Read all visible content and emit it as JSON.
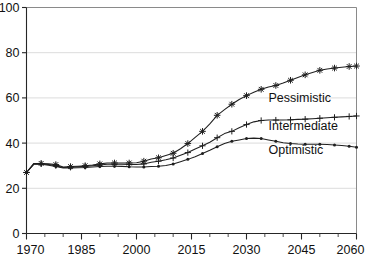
{
  "chart_data": {
    "type": "line",
    "title": "",
    "subtitle": "",
    "xlabel": "",
    "ylabel": "",
    "xlim": [
      1970,
      2060
    ],
    "ylim": [
      0,
      100
    ],
    "grid": true,
    "grid_axis": "y",
    "legend_position": "inline-annotations-right",
    "x_ticks": [
      1970,
      1985,
      2000,
      2015,
      2030,
      2045,
      2060
    ],
    "x_tick_labels": [
      "1970",
      "1985",
      "2000",
      "2015",
      "2030",
      "2045",
      "2060"
    ],
    "x_minor_tick_step": 5,
    "y_ticks": [
      0,
      20,
      40,
      60,
      80,
      100
    ],
    "y_tick_labels": [
      "0",
      "20",
      "40",
      "60",
      "80",
      "100"
    ],
    "x": [
      1970,
      1972,
      1974,
      1976,
      1978,
      1980,
      1982,
      1984,
      1986,
      1988,
      1990,
      1992,
      1994,
      1996,
      1998,
      2000,
      2002,
      2004,
      2006,
      2008,
      2010,
      2012,
      2014,
      2016,
      2018,
      2020,
      2022,
      2024,
      2026,
      2028,
      2030,
      2032,
      2034,
      2036,
      2038,
      2040,
      2042,
      2044,
      2046,
      2048,
      2050,
      2052,
      2054,
      2056,
      2058,
      2060
    ],
    "series": [
      {
        "name": "Pessimistic",
        "marker": "asterisk",
        "label": "Pessimistic",
        "label_x": 2036,
        "label_y": 58,
        "values": [
          27.0,
          31.0,
          31.0,
          30.8,
          30.5,
          29.4,
          29.6,
          29.8,
          30.0,
          30.3,
          30.8,
          31.2,
          31.2,
          31.2,
          31.2,
          31.3,
          32.0,
          33.0,
          33.5,
          34.5,
          35.5,
          37.5,
          39.8,
          42.5,
          45.2,
          48.5,
          52.3,
          54.8,
          57.2,
          59.3,
          61.0,
          62.5,
          63.8,
          64.8,
          65.5,
          66.6,
          67.8,
          69.0,
          70.2,
          71.2,
          72.2,
          72.8,
          73.2,
          73.6,
          73.9,
          74.1
        ]
      },
      {
        "name": "Intermediate",
        "marker": "plus",
        "label": "Intermediate",
        "label_x": 2036,
        "label_y": 46,
        "values": [
          27.0,
          30.8,
          30.8,
          30.5,
          30.0,
          29.2,
          29.3,
          29.5,
          29.7,
          30.0,
          30.3,
          30.6,
          30.6,
          30.6,
          30.5,
          30.5,
          30.8,
          31.5,
          32.0,
          32.6,
          33.4,
          34.6,
          35.8,
          37.4,
          38.8,
          40.4,
          42.4,
          44.2,
          45.2,
          46.8,
          48.2,
          49.4,
          50.0,
          50.2,
          50.2,
          50.2,
          50.3,
          50.5,
          50.6,
          50.8,
          51.0,
          51.2,
          51.4,
          51.6,
          51.8,
          52.0
        ]
      },
      {
        "name": "Optimistic",
        "marker": "dot",
        "label": "Optimistic",
        "label_x": 2036,
        "label_y": 35,
        "values": [
          27.0,
          30.6,
          30.6,
          30.2,
          29.6,
          29.0,
          29.0,
          29.1,
          29.2,
          29.4,
          29.6,
          29.8,
          29.8,
          29.7,
          29.5,
          29.4,
          29.4,
          29.6,
          29.8,
          30.1,
          30.8,
          31.8,
          32.8,
          34.0,
          35.4,
          36.8,
          38.4,
          39.8,
          40.8,
          41.4,
          42.0,
          42.2,
          42.0,
          41.4,
          40.8,
          40.2,
          39.8,
          39.6,
          39.5,
          39.5,
          39.5,
          39.4,
          39.2,
          38.9,
          38.6,
          38.2
        ]
      }
    ]
  },
  "footer": {
    "cut_off_text": ""
  }
}
